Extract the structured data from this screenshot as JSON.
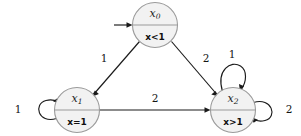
{
  "diagram": {
    "type": "finite-state-transition-diagram",
    "background_color": "#ffffff",
    "node_fill_color": "#f2f2f2",
    "node_stroke_color": "#9a9a9a",
    "edge_color": "#1a1a1a",
    "states": [
      {
        "id": "x0",
        "name": "x",
        "subscript": "0",
        "predicate": "x<1",
        "is_initial": true,
        "cx": 155,
        "cy": 25,
        "r": 22.5
      },
      {
        "id": "x1",
        "name": "x",
        "subscript": "1",
        "predicate": "x=1",
        "is_initial": false,
        "cx": 77,
        "cy": 110,
        "r": 22.5
      },
      {
        "id": "x2",
        "name": "x",
        "subscript": "2",
        "predicate": "x>1",
        "is_initial": false,
        "cx": 233,
        "cy": 110,
        "r": 22.5
      }
    ],
    "transitions": [
      {
        "id": "t-x0-x1",
        "from": "x0",
        "to": "x1",
        "label": "1",
        "kind": "diagonal"
      },
      {
        "id": "t-x0-x2",
        "from": "x0",
        "to": "x2",
        "label": "2",
        "kind": "diagonal"
      },
      {
        "id": "t-x1-x2",
        "from": "x1",
        "to": "x2",
        "label": "2",
        "kind": "horizontal"
      },
      {
        "id": "t-x1-x1",
        "from": "x1",
        "to": "x1",
        "label": "1",
        "kind": "self-loop-left"
      },
      {
        "id": "t-x2-x2-top",
        "from": "x2",
        "to": "x2",
        "label": "1",
        "kind": "self-loop-top"
      },
      {
        "id": "t-x2-x2-right",
        "from": "x2",
        "to": "x2",
        "label": "2",
        "kind": "self-loop-right"
      }
    ],
    "initial_marker": {
      "id": "initial-arrow",
      "target": "x0"
    }
  }
}
